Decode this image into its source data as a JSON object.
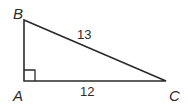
{
  "diagram": {
    "type": "right-triangle",
    "vertices": [
      {
        "id": "A",
        "label": "A",
        "x": 24,
        "y": 81,
        "right_angle": true
      },
      {
        "id": "B",
        "label": "B",
        "x": 24,
        "y": 20
      },
      {
        "id": "C",
        "label": "C",
        "x": 166,
        "y": 81
      }
    ],
    "sides": [
      {
        "from": "B",
        "to": "C",
        "label": "13"
      },
      {
        "from": "A",
        "to": "C",
        "label": "12"
      },
      {
        "from": "A",
        "to": "B",
        "label": ""
      }
    ],
    "colors": {
      "stroke": "#2b2b2b",
      "background": "#ffffff"
    }
  }
}
